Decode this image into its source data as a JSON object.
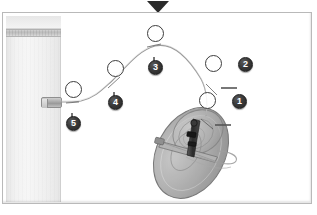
{
  "figure": {
    "type": "technical-assembly-diagram",
    "title": "",
    "background_color": "#ffffff",
    "frame_border_color": "#b9b9b9"
  },
  "marker": {
    "name": "section-marker",
    "glyph": "▼",
    "color": "#2b2b2b",
    "position": "top-center"
  },
  "left_panel": {
    "label": "",
    "band_label": "",
    "bracket_label": ""
  },
  "callouts": [
    {
      "number": "1",
      "hotspot_x": 205,
      "hotspot_y": 100,
      "badge_x": 238,
      "badge_y": 100,
      "leader": "horizontal-right"
    },
    {
      "number": "2",
      "hotspot_x": 211,
      "hotspot_y": 63,
      "badge_x": 243,
      "badge_y": 63,
      "leader": "horizontal-right"
    },
    {
      "number": "3",
      "hotspot_x": 153,
      "hotspot_y": 33,
      "badge_x": 153,
      "badge_y": 66,
      "leader": "vertical-down"
    },
    {
      "number": "4",
      "hotspot_x": 113,
      "hotspot_y": 68,
      "badge_x": 113,
      "badge_y": 101,
      "leader": "vertical-down"
    },
    {
      "number": "5",
      "hotspot_x": 71,
      "hotspot_y": 89,
      "badge_x": 71,
      "badge_y": 122,
      "leader": "vertical-down"
    }
  ],
  "colors": {
    "badge_fill": "#2a2a2a",
    "badge_text": "#ffffff",
    "leader_line": "#555555",
    "cable_line": "#8d8d8d",
    "disc_fill": "#9a9a9a",
    "disc_stroke": "#6e6e6e",
    "panel_fill": "#f2f2f2",
    "bracket_fill": "#a8a8a8"
  },
  "objects": {
    "cable": {
      "name": "routing-cable",
      "description": "curved harness routed through all five callout points"
    },
    "disc": {
      "name": "disc-assembly",
      "description": "tilted disc / dish with central mechanism and clamp"
    }
  }
}
